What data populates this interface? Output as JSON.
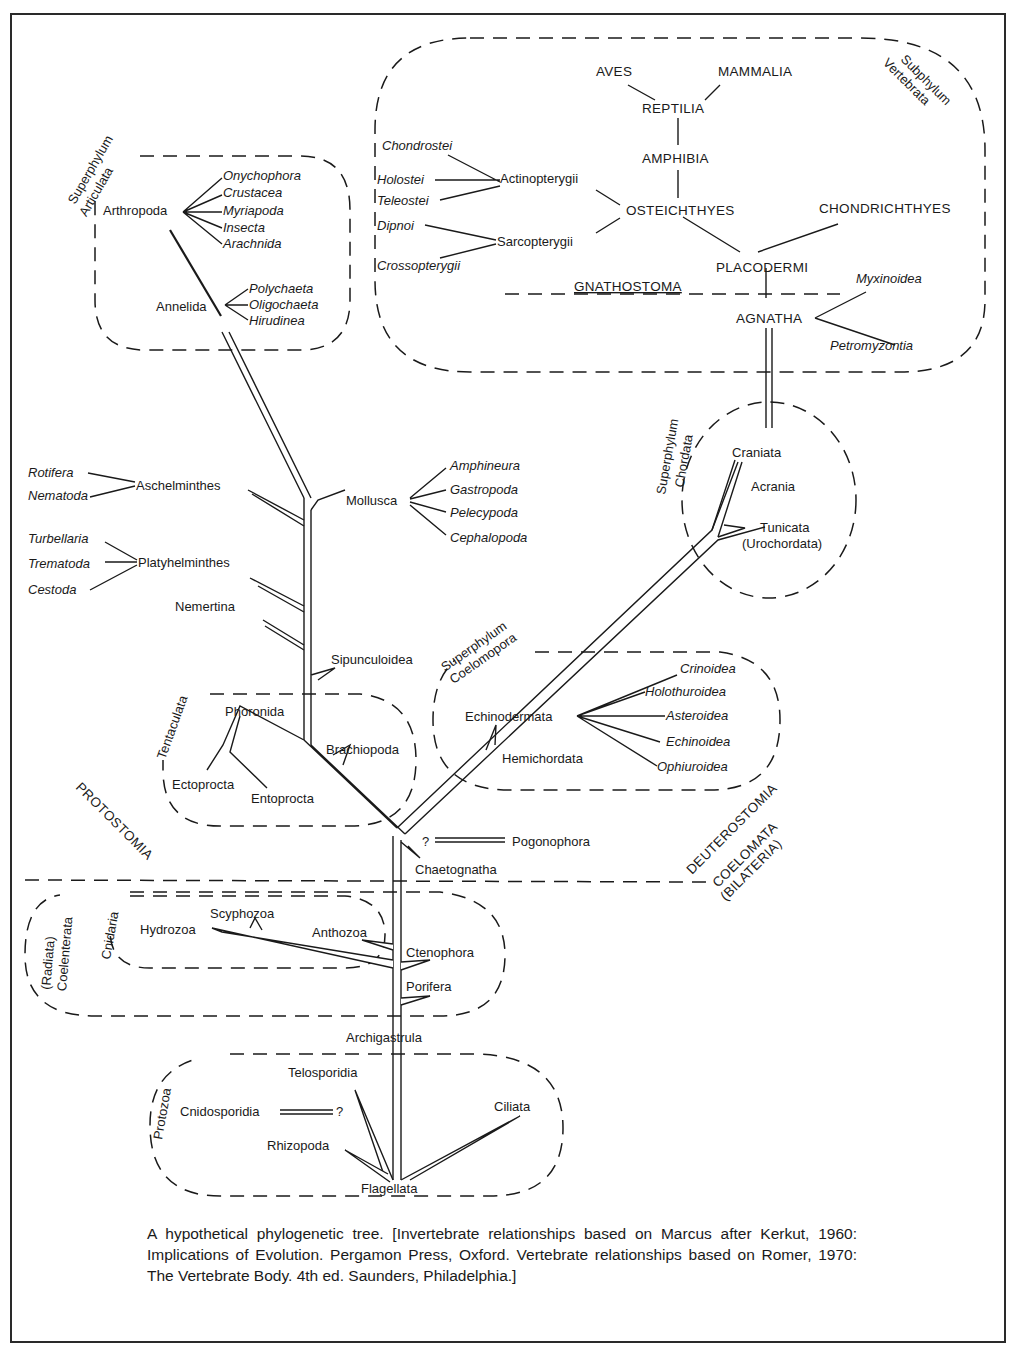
{
  "figure": {
    "caption": "A hypothetical phylogenetic tree. [Invertebrate relationships based on Marcus after Kerkut, 1960: Implications of Evolution. Pergamon Press, Oxford. Vertebrate relationships based on Romer, 1970: The Vertebrate Body. 4th ed. Saunders, Philadelphia.]"
  },
  "groups": {
    "vertebrata": {
      "line1": "Subphylum",
      "line2": "Vertebrata"
    },
    "articulata": {
      "line1": "Superphylum",
      "line2": "Articulata"
    },
    "chordata": {
      "line1": "Superphylum",
      "line2": "Chordata"
    },
    "coelomopora": {
      "line1": "Superphylum",
      "line2": "Coelomopora"
    },
    "tentaculata": {
      "label": "Tentaculata"
    },
    "coelenterata": {
      "line1": "(Radiata)",
      "line2": "Coelenterata"
    },
    "cnidaria": {
      "label": "Cnidaria"
    },
    "protozoa": {
      "label": "Protozoa"
    }
  },
  "divisions": {
    "gnathostoma": "GNATHOSTOMA",
    "protostomia": "PROTOSTOMIA",
    "deuterostomia": "DEUTEROSTOMIA",
    "coelomata": "COELOMATA",
    "bilateria": "(BILATERIA)"
  },
  "vertebrates": {
    "aves": "AVES",
    "mammalia": "MAMMALIA",
    "reptilia": "REPTILIA",
    "amphibia": "AMPHIBIA",
    "osteichthyes": "OSTEICHTHYES",
    "chondrichthyes": "CHONDRICHTHYES",
    "placodermi": "PLACODERMI",
    "agnatha": "AGNATHA",
    "actinopterygii": "Actinopterygii",
    "sarcopterygii": "Sarcopterygii",
    "chondrostei": "Chondrostei",
    "holostei": "Holostei",
    "teleostei": "Teleostei",
    "dipnoi": "Dipnoi",
    "crossopterygii": "Crossopterygii",
    "myxinoidea": "Myxinoidea",
    "petromyzontia": "Petromyzontia"
  },
  "articulata": {
    "arthropoda": "Arthropoda",
    "annelida": "Annelida",
    "arthropod_classes": [
      "Onychophora",
      "Crustacea",
      "Myriapoda",
      "Insecta",
      "Arachnida"
    ],
    "annelid_classes": [
      "Polychaeta",
      "Oligochaeta",
      "Hirudinea"
    ]
  },
  "protostomes": {
    "aschelminthes": "Aschelminthes",
    "aschelminthes_classes": [
      "Rotifera",
      "Nematoda"
    ],
    "platyhelminthes": "Platyhelminthes",
    "platyhelminthes_classes": [
      "Turbellaria",
      "Trematoda",
      "Cestoda"
    ],
    "nemertina": "Nemertina",
    "mollusca": "Mollusca",
    "mollusca_classes": [
      "Amphineura",
      "Gastropoda",
      "Pelecypoda",
      "Cephalopoda"
    ],
    "sipunculoidea": "Sipunculoidea",
    "phoronida": "Phoronida",
    "brachiopoda": "Brachiopoda",
    "ectoprocta": "Ectoprocta",
    "entoprocta": "Entoprocta"
  },
  "deuterostomes": {
    "craniata": "Craniata",
    "acrania": "Acrania",
    "tunicata": "Tunicata",
    "urochordata": "(Urochordata)",
    "echinodermata": "Echinodermata",
    "echinoderm_classes": [
      "Crinoidea",
      "Holothuroidea",
      "Asteroidea",
      "Echinoidea",
      "Ophiuroidea"
    ],
    "hemichordata": "Hemichordata",
    "pogonophora": "Pogonophora",
    "pogonophora_q": "?",
    "chaetognatha": "Chaetognatha"
  },
  "radiata": {
    "hydrozoa": "Hydrozoa",
    "scyphozoa": "Scyphozoa",
    "anthozoa": "Anthozoa",
    "ctenophora": "Ctenophora",
    "porifera": "Porifera",
    "archigastrula": "Archigastrula"
  },
  "protozoa": {
    "telosporidia": "Telosporidia",
    "cnidosporidia": "Cnidosporidia",
    "cnidosporidia_q": "?",
    "rhizopoda": "Rhizopoda",
    "ciliata": "Ciliata",
    "flagellata": "Flagellata"
  }
}
